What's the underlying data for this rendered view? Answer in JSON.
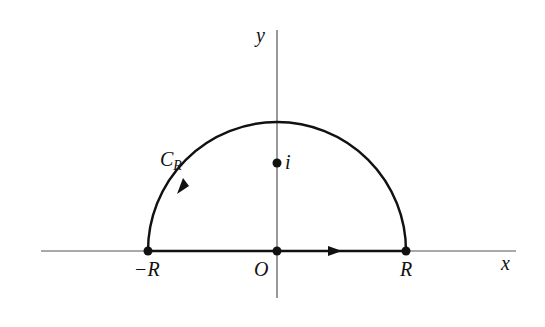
{
  "diagram": {
    "axes": {
      "x_label": "x",
      "y_label": "y"
    },
    "points": {
      "origin": "O",
      "left_end": "−R",
      "right_end": "R",
      "i_point": "i"
    },
    "contour": {
      "label_main": "C",
      "label_sub": "R"
    },
    "colors": {
      "stroke": "#111111",
      "axis": "#555555",
      "background": "#ffffff"
    }
  }
}
